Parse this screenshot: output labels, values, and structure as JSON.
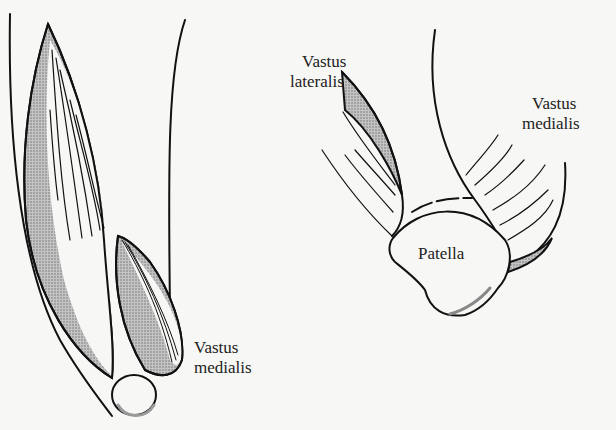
{
  "figure": {
    "left_panel": {
      "labels": {
        "vastus_medialis": [
          "Vastus",
          "medialis"
        ]
      }
    },
    "right_panel": {
      "labels": {
        "vastus_lateralis": [
          "Vastus",
          "lateralis"
        ],
        "vastus_medialis": [
          "Vastus",
          "medialis"
        ],
        "patella": "Patella"
      }
    },
    "colors": {
      "line": "#111111",
      "shade": "#9a9a9a",
      "background": "#f7f7f5"
    }
  }
}
